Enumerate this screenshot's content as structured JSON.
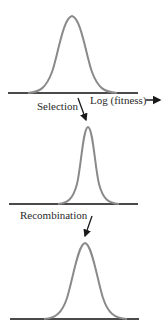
{
  "diagram": {
    "axis_label": "Log (fitness)",
    "steps": [
      {
        "label": "Selection"
      },
      {
        "label": "Recombination"
      }
    ],
    "panels": [
      {
        "name": "initial-distribution",
        "description": "broad fitness distribution"
      },
      {
        "name": "after-selection",
        "description": "narrower distribution shifted to higher fitness"
      },
      {
        "name": "after-recombination",
        "description": "broadened distribution at higher mean fitness"
      }
    ],
    "colors": {
      "curve": "#8a8a8a",
      "baseline": "#4a4a4a",
      "arrow": "#1a1a1a",
      "text": "#2a2a2a"
    }
  }
}
